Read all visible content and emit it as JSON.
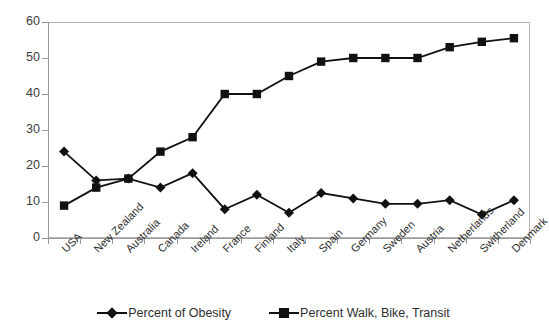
{
  "chart_data": {
    "type": "line",
    "title": "",
    "subtitle": "",
    "xlabel": "",
    "ylabel": "",
    "ylim": [
      0,
      60
    ],
    "ytick_step": 10,
    "yticks": [
      "0",
      "10",
      "20",
      "30",
      "40",
      "50",
      "60"
    ],
    "grid": false,
    "legend_position": "bottom",
    "categories": [
      "USA",
      "New Zealand",
      "Australia",
      "Canada",
      "Ireland",
      "France",
      "Finland",
      "Italy",
      "Spain",
      "Germany",
      "Sweden",
      "Austria",
      "Netherlands",
      "Switherland",
      "Denmark"
    ],
    "series": [
      {
        "name": "Percent of Obesity",
        "marker": "diamond",
        "color": "#111111",
        "values": [
          24,
          16,
          16.5,
          14,
          18,
          8,
          12,
          7,
          12.5,
          11,
          9.5,
          9.5,
          10.5,
          6.5,
          10.5
        ]
      },
      {
        "name": "Percent Walk, Bike, Transit",
        "marker": "square",
        "color": "#111111",
        "values": [
          9,
          14,
          16.5,
          24,
          28,
          40,
          40,
          45,
          49,
          50,
          50,
          50,
          53,
          54.5,
          55.5
        ]
      }
    ]
  },
  "legend": {
    "items": [
      {
        "label": "Percent of Obesity",
        "marker": "diamond-marker-icon"
      },
      {
        "label": "Percent Walk, Bike, Transit",
        "marker": "square-marker-icon"
      }
    ]
  },
  "colors": {
    "series": "#111111",
    "axis": "#9a9a9a",
    "frame": "#b5b5b5",
    "text": "#2e2e2e",
    "background": "#ffffff"
  }
}
